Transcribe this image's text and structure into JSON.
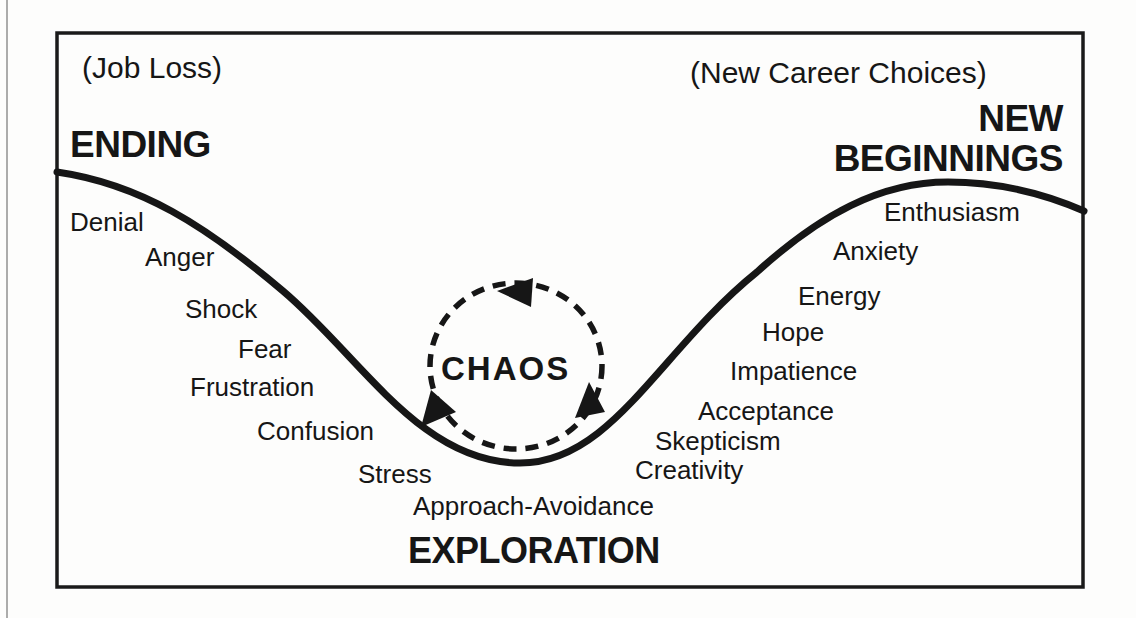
{
  "diagram": {
    "contexts": {
      "left": "(Job Loss)",
      "right": "(New Career Choices)"
    },
    "phases": {
      "ending": "ENDING",
      "new_beginnings_line1": "NEW",
      "new_beginnings_line2": "BEGINNINGS",
      "exploration": "EXPLORATION",
      "chaos": "CHAOS"
    },
    "left_emotions": [
      "Denial",
      "Anger",
      "Shock",
      "Fear",
      "Frustration",
      "Confusion",
      "Stress",
      "Approach-Avoidance"
    ],
    "right_emotions": [
      "Enthusiasm",
      "Anxiety",
      "Energy",
      "Hope",
      "Impatience",
      "Acceptance",
      "Skepticism",
      "Creativity"
    ],
    "icons": {
      "chaos_cycle": "dashed-circular-arrows-icon",
      "curve": "transition-curve"
    },
    "colors": {
      "ink": "#161616",
      "paper": "#fdfdfc"
    }
  }
}
